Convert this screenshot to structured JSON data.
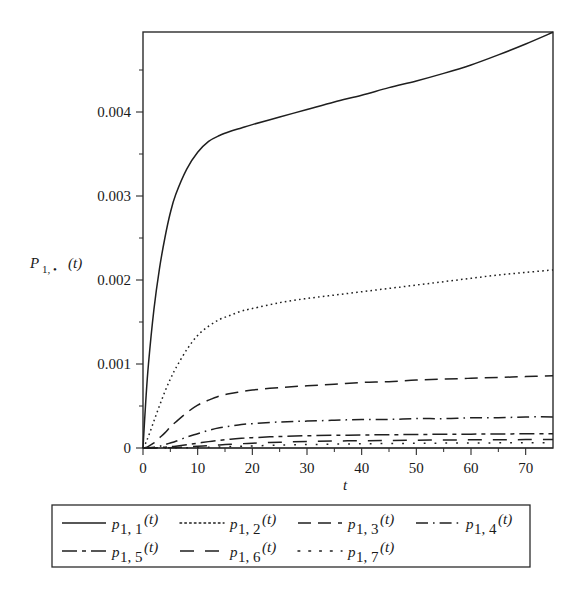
{
  "figure": {
    "background_color": "#ffffff",
    "ink_color": "#1f1f1f"
  },
  "axes": {
    "y_label": "P",
    "y_label_sub": "1, •",
    "y_label_arg": "(t)",
    "x_label": "t",
    "x_ticks": [
      "0",
      "10",
      "20",
      "30",
      "40",
      "50",
      "60",
      "70"
    ],
    "x_tick_values": [
      0,
      10,
      20,
      30,
      40,
      50,
      60,
      70
    ],
    "y_ticks": [
      "0",
      "0.001",
      "0.002",
      "0.003",
      "0.004"
    ],
    "y_tick_values": [
      0,
      0.001,
      0.002,
      0.003,
      0.004
    ]
  },
  "legend": {
    "entries": [
      {
        "label_base": "p",
        "label_sub": "1, 1",
        "label_arg": "(t)",
        "dash": "none"
      },
      {
        "label_base": "p",
        "label_sub": "1, 2",
        "label_arg": "(t)",
        "dash": "dotted"
      },
      {
        "label_base": "p",
        "label_sub": "1, 3",
        "label_arg": "(t)",
        "dash": "long-dash"
      },
      {
        "label_base": "p",
        "label_sub": "1, 4",
        "label_arg": "(t)",
        "dash": "dash-dot"
      },
      {
        "label_base": "p",
        "label_sub": "1, 5",
        "label_arg": "(t)",
        "dash": "long-dash-short-dash"
      },
      {
        "label_base": "p",
        "label_sub": "1, 6",
        "label_arg": "(t)",
        "dash": "long-dash-gap"
      },
      {
        "label_base": "p",
        "label_sub": "1, 7",
        "label_arg": "(t)",
        "dash": "sparse-dot"
      }
    ]
  },
  "chart_data": {
    "type": "line",
    "title": "",
    "subtitle": "",
    "xlabel": "t",
    "ylabel": "P_{1,•}(t)",
    "xlim": [
      0,
      75
    ],
    "ylim": [
      0,
      0.00495
    ],
    "grid": false,
    "legend_position": "below",
    "x": [
      0,
      0.5,
      1,
      2,
      3,
      4,
      5,
      6,
      8,
      10,
      12,
      14,
      16,
      18,
      20,
      25,
      30,
      35,
      40,
      45,
      50,
      55,
      60,
      65,
      70,
      75
    ],
    "series": [
      {
        "name": "p_{1,1}(t)",
        "style": "solid",
        "values": [
          0,
          0.00055,
          0.001,
          0.00165,
          0.00213,
          0.0025,
          0.0028,
          0.00302,
          0.00332,
          0.00352,
          0.00365,
          0.00372,
          0.00377,
          0.00381,
          0.00385,
          0.00394,
          0.00403,
          0.00412,
          0.0042,
          0.00429,
          0.00437,
          0.00446,
          0.00456,
          0.00468,
          0.00481,
          0.00495
        ]
      },
      {
        "name": "p_{1,2}(t)",
        "style": "dotted",
        "values": [
          0,
          6e-05,
          0.00014,
          0.00032,
          0.0005,
          0.00067,
          0.00082,
          0.00095,
          0.00117,
          0.00134,
          0.00145,
          0.00153,
          0.00158,
          0.00163,
          0.00166,
          0.00173,
          0.00178,
          0.00182,
          0.00186,
          0.0019,
          0.00194,
          0.00198,
          0.00202,
          0.00206,
          0.00209,
          0.00212
        ]
      },
      {
        "name": "p_{1,3}(t)",
        "style": "long-dash",
        "values": [
          0,
          5e-06,
          2e-05,
          6e-05,
          0.00012,
          0.00018,
          0.00025,
          0.00031,
          0.00042,
          0.00051,
          0.00057,
          0.00062,
          0.00065,
          0.00067,
          0.00069,
          0.00072,
          0.00074,
          0.00076,
          0.00078,
          0.00079,
          0.00081,
          0.00082,
          0.00083,
          0.00084,
          0.00085,
          0.00086
        ]
      },
      {
        "name": "p_{1,4}(t)",
        "style": "dash-dot",
        "values": [
          0,
          5e-07,
          3e-06,
          1e-05,
          2e-05,
          4e-05,
          6e-05,
          8e-05,
          0.00013,
          0.00017,
          0.00021,
          0.00024,
          0.00026,
          0.00028,
          0.00029,
          0.00031,
          0.00032,
          0.00033,
          0.00034,
          0.00034,
          0.00035,
          0.00035,
          0.00036,
          0.00036,
          0.00037,
          0.00037
        ]
      },
      {
        "name": "p_{1,5}(t)",
        "style": "long-dash-short-dash",
        "values": [
          0,
          1e-07,
          5e-07,
          2e-06,
          5e-06,
          9e-06,
          1.5e-05,
          2.2e-05,
          3.9e-05,
          5.8e-05,
          7.6e-05,
          9.2e-05,
          0.000105,
          0.000115,
          0.000123,
          0.000137,
          0.000146,
          0.000151,
          0.000155,
          0.000158,
          0.000161,
          0.000163,
          0.000165,
          0.000167,
          0.000169,
          0.000171
        ]
      },
      {
        "name": "p_{1,6}(t)",
        "style": "long-dash-gap",
        "values": [
          0,
          2e-08,
          1e-07,
          4e-07,
          1e-06,
          2e-06,
          4e-06,
          6e-06,
          1.2e-05,
          2e-05,
          2.8e-05,
          3.6e-05,
          4.4e-05,
          5.1e-05,
          5.7e-05,
          6.9e-05,
          7.7e-05,
          8.3e-05,
          8.7e-05,
          9e-05,
          9.3e-05,
          9.5e-05,
          9.7e-05,
          9.8e-05,
          0.0001,
          0.000101
        ]
      },
      {
        "name": "p_{1,7}(t)",
        "style": "sparse-dot",
        "values": [
          0,
          3e-09,
          2e-08,
          8e-08,
          2e-07,
          5e-07,
          1e-06,
          1.5e-06,
          3e-06,
          6e-06,
          9e-06,
          1.3e-05,
          1.7e-05,
          2.1e-05,
          2.5e-05,
          3.4e-05,
          4.1e-05,
          4.6e-05,
          5e-05,
          5.3e-05,
          5.6e-05,
          5.8e-05,
          6e-05,
          6.1e-05,
          6.3e-05,
          6.4e-05
        ]
      }
    ]
  }
}
